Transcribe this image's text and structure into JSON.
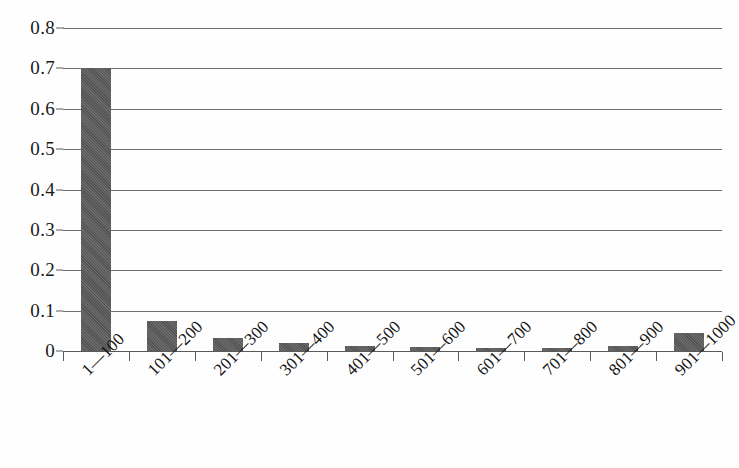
{
  "chart_data": {
    "type": "bar",
    "title": "",
    "subtitle": "",
    "xlabel": "",
    "ylabel": "",
    "categories": [
      "1—100",
      "101—200",
      "201—300",
      "301—400",
      "401—500",
      "501—600",
      "601—700",
      "701—800",
      "801—900",
      "901—1000"
    ],
    "values": [
      0.7,
      0.074,
      0.032,
      0.019,
      0.013,
      0.009,
      0.008,
      0.008,
      0.012,
      0.045
    ],
    "ylim": [
      0,
      0.8
    ],
    "ytick_labels": [
      "0.8",
      "0.7",
      "0.6",
      "0.5",
      "0.4",
      "0.3",
      "0.2",
      "0.1",
      "0"
    ],
    "ytick_values": [
      0.8,
      0.7,
      0.6,
      0.5,
      0.4,
      0.3,
      0.2,
      0.1,
      0
    ],
    "grid": true,
    "legend": false,
    "legend_position": "none",
    "bar_color": "#5a5a5a",
    "gridline_color": "#6e6e6e",
    "axis_color": "#5a5a5a",
    "background_color": "#fefefe"
  }
}
